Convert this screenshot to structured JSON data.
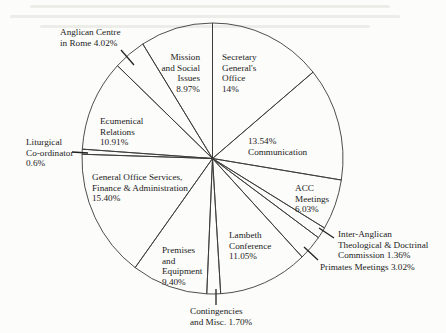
{
  "chart_data": {
    "type": "pie",
    "title": "",
    "start_angle_deg": 0,
    "direction": "clockwise",
    "slices": [
      {
        "label": "Secretary General's Office",
        "value": 14.0,
        "value_label": "14%"
      },
      {
        "label": "Communication",
        "value": 13.54,
        "value_label": "13.54%"
      },
      {
        "label": "ACC Meetings",
        "value": 6.03,
        "value_label": "6.03%"
      },
      {
        "label": "Inter-Anglican Theological & Doctrinal Commission",
        "value": 1.36,
        "value_label": "1.36%"
      },
      {
        "label": "Primates Meetings",
        "value": 3.02,
        "value_label": "3.02%"
      },
      {
        "label": "Lambeth Conference",
        "value": 11.05,
        "value_label": "11.05%"
      },
      {
        "label": "Contingencies and Misc.",
        "value": 1.7,
        "value_label": "1.70%"
      },
      {
        "label": "Premises and Equipment",
        "value": 9.4,
        "value_label": "9.40%"
      },
      {
        "label": "General Office Services, Finance & Administration",
        "value": 15.4,
        "value_label": "15.40%"
      },
      {
        "label": "Liturgical Co-ordinator",
        "value": 0.6,
        "value_label": "0.6%"
      },
      {
        "label": "Ecumenical Relations",
        "value": 10.91,
        "value_label": "10.91%"
      },
      {
        "label": "Anglican Centre in Rome",
        "value": 4.02,
        "value_label": "4.02%"
      },
      {
        "label": "Mission and Social Issues",
        "value": 8.97,
        "value_label": "8.97%"
      }
    ],
    "legend": "none (labels placed on/next to slices)",
    "fill": "none (white with black outlines)"
  },
  "labels": {
    "secretary": [
      "Secretary",
      "General's",
      "Office",
      "14%"
    ],
    "communication": [
      "13.54%",
      "Communication"
    ],
    "acc": [
      "ACC",
      "Meetings",
      "6.03%"
    ],
    "inter_anglican": [
      "Inter-Anglican",
      "Theological & Doctrinal",
      "Commission 1.36%"
    ],
    "primates": [
      "Primates Meetings 3.02%"
    ],
    "lambeth": [
      "Lambeth",
      "Conference",
      "11.05%"
    ],
    "contingencies": [
      "Contingencies",
      "and Misc. 1.70%"
    ],
    "premises": [
      "Premises",
      "and",
      "Equipment",
      "9.40%"
    ],
    "general_office": [
      "General Office Services,",
      "Finance & Administration",
      "15.40%"
    ],
    "liturgical": [
      "Liturgical",
      "Co-ordinator",
      "0.6%"
    ],
    "ecumenical": [
      "Ecumenical",
      "Relations",
      "10.91%"
    ],
    "anglican_centre": [
      "Anglican Centre",
      "in Rome 4.02%"
    ],
    "mission": [
      "Mission",
      "and Social",
      "Issues",
      "8.97%"
    ]
  },
  "style": {
    "stroke": "#3a3a3a",
    "background": "#fcfcfa"
  }
}
